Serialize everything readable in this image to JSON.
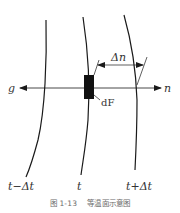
{
  "figure": {
    "caption_number": "图 1-13",
    "caption_title": "等温面示意图"
  },
  "isotherms": [
    {
      "label": "t−Δt",
      "label_main": "t",
      "label_suffix": "−Δt"
    },
    {
      "label": "t",
      "label_main": "t",
      "label_suffix": ""
    },
    {
      "label": "t+Δt",
      "label_main": "t",
      "label_suffix": "+Δt"
    }
  ],
  "axis": {
    "left_label": "g",
    "right_label": "n"
  },
  "element": {
    "label": "dF"
  },
  "dimension": {
    "label": "Δn"
  },
  "colors": {
    "line": "#1a1a1a",
    "text": "#333333",
    "caption": "#6b6b6b"
  }
}
